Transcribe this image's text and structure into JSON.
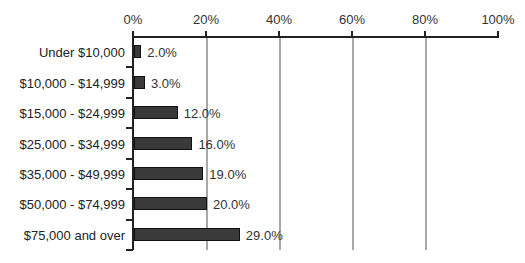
{
  "chart_data": {
    "type": "bar",
    "orientation": "horizontal",
    "title": "",
    "xlabel": "",
    "ylabel": "",
    "xlim": [
      0,
      100
    ],
    "x_ticks": [
      "0%",
      "20%",
      "40%",
      "60%",
      "80%",
      "100%"
    ],
    "grid": "vertical",
    "legend": "none",
    "categories": [
      "Under $10,000",
      "$10,000 - $14,999",
      "$15,000 - $24,999",
      "$25,000 - $34,999",
      "$35,000 - $49,999",
      "$50,000 - $74,999",
      "$75,000 and over"
    ],
    "values": [
      2.0,
      3.0,
      12.0,
      16.0,
      19.0,
      20.0,
      29.0
    ],
    "value_labels": [
      "2.0%",
      "3.0%",
      "12.0%",
      "16.0%",
      "19.0%",
      "20.0%",
      "29.0%"
    ],
    "colors": {
      "bar": "#3a3a3a",
      "bar_border": "#111111",
      "grid": "#a8a8a8",
      "axis": "#222222"
    }
  }
}
